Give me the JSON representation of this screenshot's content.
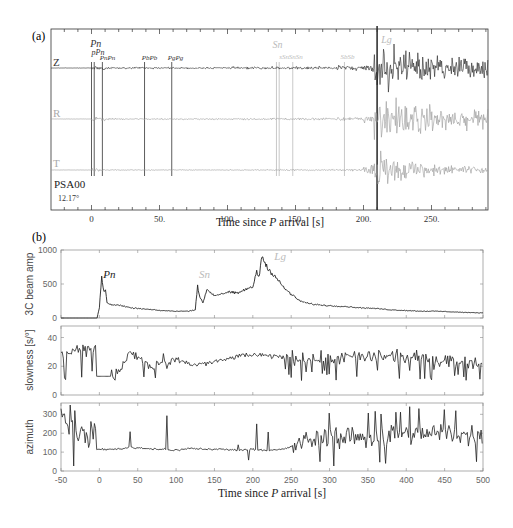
{
  "chart_data": [
    {
      "panel_label": "(a)",
      "type": "line",
      "title": "",
      "xlabel": "Time since P arrival [s]",
      "ylabel": "",
      "xlim": [
        -30,
        292
      ],
      "x_ticks": [
        0,
        50,
        100,
        150,
        200,
        250
      ],
      "x_tick_labels": [
        "0",
        "50.",
        "100.",
        "150.",
        "200.",
        "250."
      ],
      "station": "PSA00",
      "distance": "12.17°",
      "series": [
        {
          "name": "Z",
          "color": "#222222",
          "description": "vertical component seismogram; noise before 0 s, Pn onset at 0 s, large Lg arrivals ~210-260 s"
        },
        {
          "name": "R",
          "color": "#999999",
          "description": "radial component seismogram; Lg arrivals ~205-290 s"
        },
        {
          "name": "T",
          "color": "#999999",
          "description": "transverse component seismogram; Lg arrivals ~210-240 s"
        }
      ],
      "phase_markers": [
        {
          "label": "Pn",
          "time": 0,
          "color": "#333333"
        },
        {
          "label": "pPn",
          "time": 2,
          "color": "#333333"
        },
        {
          "label": "PnPn",
          "time": 8,
          "color": "#333333"
        },
        {
          "label": "PbPb",
          "time": 39,
          "color": "#333333"
        },
        {
          "label": "PgPg",
          "time": 59,
          "color": "#333333"
        },
        {
          "label": "Sn",
          "time": 136,
          "color": "#bbbbbb"
        },
        {
          "label": "sSn",
          "time": 138,
          "color": "#bbbbbb"
        },
        {
          "label": "SnSn",
          "time": 148,
          "color": "#bbbbbb"
        },
        {
          "label": "SbSb",
          "time": 186,
          "color": "#bbbbbb"
        },
        {
          "label": "Lg",
          "time": 210,
          "color": "#bbbbbb"
        }
      ]
    },
    {
      "panel_label": "(b)",
      "type": "line",
      "xlabel": "Time since P arrival [s]",
      "xlim": [
        -50,
        500
      ],
      "x_ticks": [
        -50,
        0,
        50,
        100,
        150,
        200,
        250,
        300,
        350,
        400,
        450,
        500
      ],
      "subplots": [
        {
          "ylabel": "3C beam amp",
          "ylim": [
            0,
            1000
          ],
          "y_ticks": [
            0,
            500,
            1000
          ],
          "annotations": [
            {
              "label": "Pn",
              "x": 5,
              "y": 620,
              "color": "#222222"
            },
            {
              "label": "Sn",
              "x": 130,
              "y": 620,
              "color": "#bbbbbb"
            },
            {
              "label": "Lg",
              "x": 228,
              "y": 880,
              "color": "#bbbbbb"
            }
          ],
          "x": [
            -50,
            -10,
            -3,
            0,
            3,
            6,
            8,
            10,
            15,
            25,
            40,
            60,
            80,
            100,
            115,
            125,
            128,
            131,
            135,
            140,
            150,
            160,
            170,
            180,
            190,
            200,
            205,
            208,
            212,
            215,
            218,
            221,
            225,
            230,
            240,
            250,
            260,
            270,
            280,
            300,
            320,
            340,
            360,
            380,
            400,
            420,
            440,
            460,
            480,
            500
          ],
          "values": [
            0,
            0,
            0,
            150,
            600,
            380,
            420,
            220,
            200,
            190,
            150,
            130,
            110,
            100,
            100,
            120,
            480,
            300,
            220,
            420,
            330,
            360,
            380,
            360,
            420,
            450,
            700,
            580,
            950,
            800,
            780,
            720,
            650,
            600,
            450,
            350,
            260,
            220,
            200,
            180,
            170,
            150,
            140,
            120,
            110,
            100,
            100,
            90,
            80,
            75
          ]
        },
        {
          "ylabel": "slowness [s/°]",
          "ylim": [
            0,
            48
          ],
          "y_ticks": [
            0,
            20,
            40
          ],
          "x": [
            -50,
            -40,
            -30,
            -20,
            -10,
            -5,
            -4,
            20,
            30,
            40,
            50,
            60,
            70,
            80,
            90,
            100,
            120,
            140,
            160,
            180,
            200,
            220,
            250,
            300,
            350,
            400,
            450,
            500
          ],
          "values": [
            30,
            28,
            34,
            30,
            34,
            32,
            13,
            13,
            20,
            30,
            26,
            22,
            18,
            24,
            20,
            25,
            21,
            22,
            24,
            27,
            28,
            27,
            26,
            25,
            27,
            26,
            25,
            22
          ],
          "note": "noisy fluctuations between ~10 and ~38 throughout"
        },
        {
          "ylabel": "azimuth",
          "ylim": [
            0,
            360
          ],
          "y_ticks": [
            0,
            100,
            200,
            300
          ],
          "x": [
            -50,
            -40,
            -30,
            -20,
            -10,
            -5,
            -4,
            20,
            40,
            60,
            80,
            100,
            120,
            140,
            160,
            180,
            200,
            220,
            240,
            260,
            280,
            300,
            350,
            400,
            450,
            500
          ],
          "values": [
            300,
            250,
            220,
            180,
            200,
            200,
            115,
            115,
            125,
            120,
            115,
            110,
            120,
            115,
            115,
            110,
            115,
            110,
            115,
            140,
            170,
            180,
            180,
            190,
            200,
            180
          ],
          "note": "large scatter 0-350 before 0 s and after ~250 s; stable ~115 between 0 and 220 s"
        }
      ]
    }
  ],
  "labels": {
    "panel_a": "(a)",
    "panel_b": "(b)",
    "xlabel_prefix": "Time since ",
    "xlabel_italic": "P",
    "xlabel_suffix": " arrival [s]",
    "trace_z": "Z",
    "trace_r": "R",
    "trace_t": "T",
    "station": "PSA00",
    "distance": "12.17°",
    "ylabel_amp": "3C beam amp",
    "ylabel_slowness": "slowness [s/°]",
    "ylabel_azimuth": "azimuth"
  }
}
